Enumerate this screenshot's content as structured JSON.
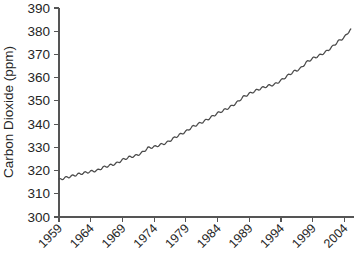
{
  "chart_data": {
    "type": "line",
    "title": "",
    "subtitle": "",
    "xlabel": "",
    "ylabel": "Carbon Dioxide (ppm)",
    "xlim": [
      1959,
      2005.5
    ],
    "ylim": [
      300,
      390
    ],
    "ytick_values": [
      300,
      310,
      320,
      330,
      340,
      350,
      360,
      370,
      380,
      390
    ],
    "ytick_labels": [
      "300",
      "310",
      "320",
      "330",
      "340",
      "350",
      "360",
      "370",
      "380",
      "390"
    ],
    "xtick_values": [
      1959,
      1964,
      1969,
      1974,
      1979,
      1984,
      1989,
      1994,
      1999,
      2004
    ],
    "xtick_labels": [
      "1959",
      "1964",
      "1969",
      "1974",
      "1979",
      "1984",
      "1989",
      "1994",
      "1999",
      "2004"
    ],
    "grid": false,
    "legend": null,
    "legend_position": "none",
    "series": [
      {
        "name": "Atmospheric Carbon Dioxide",
        "color": "#4a4a4a",
        "x": [
          1959,
          1960,
          1961,
          1962,
          1963,
          1964,
          1965,
          1966,
          1967,
          1968,
          1969,
          1970,
          1971,
          1972,
          1973,
          1974,
          1975,
          1976,
          1977,
          1978,
          1979,
          1980,
          1981,
          1982,
          1983,
          1984,
          1985,
          1986,
          1987,
          1988,
          1989,
          1990,
          1991,
          1992,
          1993,
          1994,
          1995,
          1996,
          1997,
          1998,
          1999,
          2000,
          2001,
          2002,
          2003,
          2004,
          2005
        ],
        "values": [
          316.0,
          316.9,
          317.6,
          318.4,
          319.0,
          319.6,
          320.0,
          321.4,
          322.2,
          323.0,
          324.6,
          325.7,
          326.3,
          327.5,
          329.7,
          330.2,
          331.1,
          332.0,
          333.8,
          335.4,
          336.8,
          338.8,
          340.1,
          341.4,
          343.0,
          344.7,
          346.0,
          347.4,
          349.2,
          351.6,
          353.1,
          354.4,
          355.6,
          356.5,
          357.1,
          358.8,
          360.8,
          362.6,
          363.8,
          366.6,
          368.3,
          369.5,
          371.0,
          373.1,
          375.6,
          377.4,
          381.0
        ]
      }
    ],
    "annotations": [],
    "note": "Atmospheric carbon dioxide concentration measured at Mauna Loa Observatory, annual mean values"
  },
  "figure": {
    "background_color": "#ffffff",
    "line_color": "#4a4a4a",
    "axis_color": "#555555",
    "text_color": "#252525",
    "xtick_label_rotation_degrees": 45
  }
}
